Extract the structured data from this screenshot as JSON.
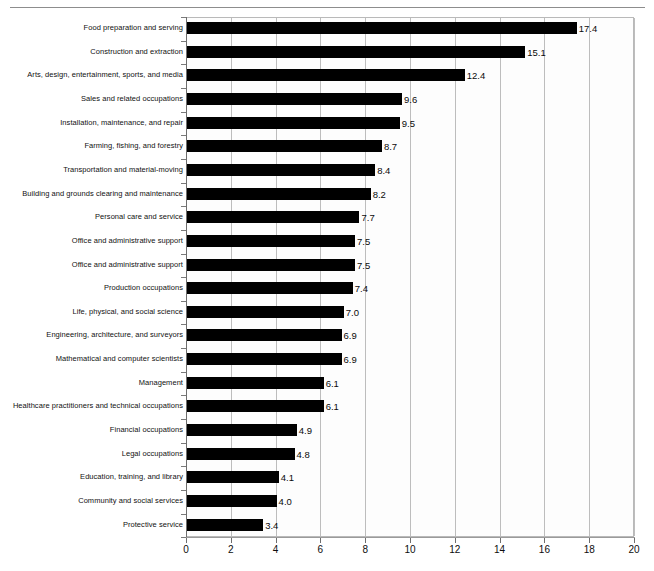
{
  "chart_data": {
    "type": "bar",
    "orientation": "horizontal",
    "title": "",
    "subtitle": "",
    "xlabel": "",
    "ylabel": "",
    "xlim": [
      0,
      20
    ],
    "xticks": [
      0,
      2,
      4,
      6,
      8,
      10,
      12,
      14,
      16,
      18,
      20
    ],
    "xtick_labels": [
      "0",
      "2",
      "4",
      "6",
      "8",
      "10",
      "12",
      "14",
      "16",
      "18",
      "20"
    ],
    "grid": true,
    "grid_axis": "x",
    "legend": false,
    "bar_color": "#000000",
    "categories": [
      "Food preparation and serving",
      "Construction and extraction",
      "Arts, design, entertainment, sports, and media",
      "Sales and related occupations",
      "Installation, maintenance, and repair",
      "Farming, fishing, and forestry",
      "Transportation and material-moving",
      "Building and grounds clearing and maintenance",
      "Personal care and service",
      "Office and administrative support",
      "Office and administrative support",
      "Production occupations",
      "Life, physical, and social science",
      "Engineering, architecture, and surveyors",
      "Mathematical and computer scientists",
      "Management",
      "Healthcare practitioners and technical occupations",
      "Financial occupations",
      "Legal occupations",
      "Education, training, and library",
      "Community and social services",
      "Protective service"
    ],
    "values": [
      17.4,
      15.1,
      12.4,
      9.6,
      9.5,
      8.7,
      8.4,
      8.2,
      7.7,
      7.5,
      7.5,
      7.4,
      7.0,
      6.9,
      6.9,
      6.1,
      6.1,
      4.9,
      4.8,
      4.1,
      4.0,
      3.4
    ],
    "value_labels": [
      "17.4",
      "15.1",
      "12.4",
      "9.6",
      "9.5",
      "8.7",
      "8.4",
      "8.2",
      "7.7",
      "7.5",
      "7.5",
      "7.4",
      "7.0",
      "6.9",
      "6.9",
      "6.1",
      "6.1",
      "4.9",
      "4.8",
      "4.1",
      "4.0",
      "3.4"
    ]
  }
}
